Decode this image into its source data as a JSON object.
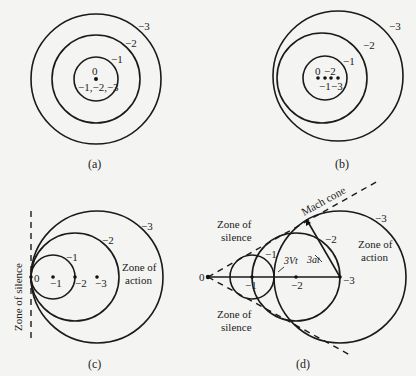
{
  "figure": {
    "panels": [
      {
        "id": "a",
        "caption": "(a)",
        "description": "Stationary source: concentric wavefronts",
        "labels": {
          "center_top": "0",
          "center_bottom": "−1,−2,−3",
          "ring1": "−1",
          "ring2": "−2",
          "ring3": "−3"
        }
      },
      {
        "id": "b",
        "caption": "(b)",
        "description": "Subsonic moving source: non-concentric wavefronts",
        "labels": {
          "point0": "0",
          "point2": "−2",
          "point1": "−1",
          "point3": "−3",
          "ring1": "−1",
          "ring2": "−2",
          "ring3": "−3"
        }
      },
      {
        "id": "c",
        "caption": "(c)",
        "description": "Sonic source: wavefronts coalesce at the source",
        "labels": {
          "point0": "0",
          "point1": "−1",
          "point2": "−2",
          "point3": "−3",
          "ring1": "−1",
          "ring2": "−2",
          "ring3": "−3"
        },
        "zone_silence": "Zone of silence",
        "zone_action_line1": "Zone of",
        "zone_action_line2": "action"
      },
      {
        "id": "d",
        "caption": "(d)",
        "description": "Supersonic source: Mach cone",
        "labels": {
          "point0": "0",
          "point1": "−1",
          "point2": "−2",
          "point3": "−3",
          "ring1": "−1",
          "ring2": "−2",
          "ring3": "−3"
        },
        "mach_cone": "Mach cone",
        "distance_source": "3Vt",
        "distance_wave": "3at",
        "zone_silence_top_line1": "Zone of",
        "zone_silence_top_line2": "silence",
        "zone_silence_bottom_line1": "Zone of",
        "zone_silence_bottom_line2": "silence",
        "zone_action_line1": "Zone of",
        "zone_action_line2": "action"
      }
    ]
  }
}
